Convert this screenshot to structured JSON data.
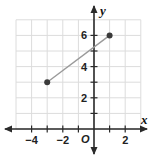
{
  "chart_data": {
    "type": "line",
    "title": "",
    "xlabel": "x",
    "ylabel": "y",
    "origin_label": "O",
    "xlim": [
      -5,
      3
    ],
    "ylim": [
      0,
      7
    ],
    "grid": true,
    "x_ticks": [
      -4,
      -2,
      2
    ],
    "x_tick_labels": [
      "−4",
      "−2",
      "2"
    ],
    "y_ticks": [
      2,
      4,
      6
    ],
    "y_tick_labels": [
      "2",
      "4",
      "6"
    ],
    "series": [
      {
        "name": "segment",
        "points": [
          {
            "x": -3,
            "y": 3
          },
          {
            "x": 1,
            "y": 6
          }
        ],
        "color": "#9a9a9a",
        "marker_color": "#3a3a3a"
      }
    ]
  },
  "colors": {
    "grid": "#dcdcdc",
    "axis": "#2a2a2a",
    "segment": "#9a9a9a",
    "point": "#3a3a3a"
  }
}
